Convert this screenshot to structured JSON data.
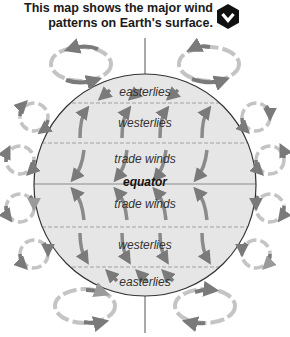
{
  "caption": {
    "line1": "This map shows the major wind",
    "line2": "patterns on Earth's surface."
  },
  "toggle_icon": "hexagon-chevron-down-icon",
  "colors": {
    "globe_fill": "#e6e6e6",
    "globe_outline": "#333333",
    "dashed_lines": "#9a9a9a",
    "arrow_dark": "#7a7a7a",
    "arrow_light": "#c4c4c4",
    "axis": "#555555",
    "button": "#111111"
  },
  "bands": [
    {
      "label": "easterlies",
      "region": "north-polar"
    },
    {
      "label": "westerlies",
      "region": "north-mid-latitude"
    },
    {
      "label": "trade winds",
      "region": "north-tropics"
    },
    {
      "label": "equator",
      "region": "equator-line"
    },
    {
      "label": "trade winds",
      "region": "south-tropics"
    },
    {
      "label": "westerlies",
      "region": "south-mid-latitude"
    },
    {
      "label": "easterlies",
      "region": "south-polar"
    }
  ]
}
